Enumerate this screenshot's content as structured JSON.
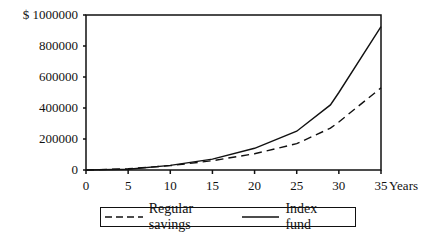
{
  "chart_data": {
    "type": "line",
    "title": "",
    "xlabel": "Years",
    "ylabel": "$",
    "xlim": [
      0,
      35
    ],
    "ylim": [
      0,
      1000000
    ],
    "x_ticks": [
      0,
      5,
      10,
      15,
      20,
      25,
      30,
      35
    ],
    "y_ticks": [
      0,
      200000,
      400000,
      600000,
      800000,
      1000000
    ],
    "y_tick_labels": [
      "0",
      "200000",
      "400000",
      "600000",
      "800000",
      "$ 1000000"
    ],
    "grid": false,
    "legend_position": "bottom",
    "x": [
      0,
      5,
      10,
      15,
      20,
      25,
      29,
      30,
      35
    ],
    "series": [
      {
        "name": "Regular savings",
        "style": "dashed",
        "values": [
          0,
          8000,
          28000,
          60000,
          105000,
          170000,
          270000,
          310000,
          530000
        ]
      },
      {
        "name": "Index fund",
        "style": "solid",
        "values": [
          0,
          5000,
          30000,
          70000,
          140000,
          250000,
          420000,
          500000,
          925000
        ]
      }
    ]
  },
  "legend": {
    "items": [
      {
        "label": "Regular savings",
        "style": "dashed"
      },
      {
        "label": "Index fund",
        "style": "solid"
      }
    ]
  },
  "axis": {
    "x_unit_label": "Years"
  }
}
